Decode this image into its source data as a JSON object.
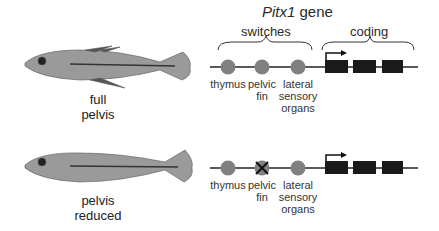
{
  "title": {
    "italic": "Pitx1",
    "rest": " gene"
  },
  "groups": {
    "switches": "switches",
    "coding": "coding"
  },
  "rows": [
    {
      "caption_line1": "full",
      "caption_line2": "pelvis",
      "switches": [
        {
          "l1": "thymus",
          "l2": "",
          "l3": "",
          "disabled": false
        },
        {
          "l1": "pelvic",
          "l2": "fin",
          "l3": "",
          "disabled": false
        },
        {
          "l1": "lateral",
          "l2": "sensory",
          "l3": "organs",
          "disabled": false
        }
      ]
    },
    {
      "caption_line1": "pelvis",
      "caption_line2": "reduced",
      "switches": [
        {
          "l1": "thymus",
          "l2": "",
          "l3": "",
          "disabled": false
        },
        {
          "l1": "pelvic",
          "l2": "fin",
          "l3": "",
          "disabled": true
        },
        {
          "l1": "lateral",
          "l2": "sensory",
          "l3": "organs",
          "disabled": false
        }
      ]
    }
  ],
  "colors": {
    "switch": "#808080",
    "exon": "#1a1a1a",
    "line": "#222222"
  }
}
